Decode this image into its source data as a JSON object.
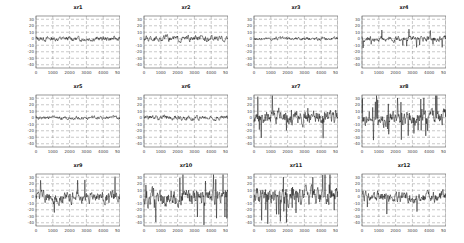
{
  "chart_data": [
    {
      "type": "line",
      "title": "xr1",
      "xlim": [
        0,
        5000
      ],
      "ylim": [
        -45,
        35
      ],
      "xticks": [
        0,
        1000,
        2000,
        3000,
        4000,
        5000
      ],
      "yticks": [
        30,
        20,
        10,
        0,
        -10,
        -20,
        -30,
        -40
      ],
      "grid": "dashed",
      "amplitude": 4,
      "spikes": 0
    },
    {
      "type": "line",
      "title": "xr2",
      "xlim": [
        0,
        5000
      ],
      "ylim": [
        -45,
        35
      ],
      "xticks": [
        0,
        1000,
        2000,
        3000,
        4000,
        5000
      ],
      "yticks": [
        30,
        20,
        10,
        0,
        -10,
        -20,
        -30,
        -40
      ],
      "grid": "dashed",
      "amplitude": 5,
      "spikes": 0
    },
    {
      "type": "line",
      "title": "xr3",
      "xlim": [
        0,
        5000
      ],
      "ylim": [
        -45,
        35
      ],
      "xticks": [
        0,
        1000,
        2000,
        3000,
        4000,
        5000
      ],
      "yticks": [
        30,
        20,
        10,
        0,
        -10,
        -20,
        -30,
        -40
      ],
      "grid": "dashed",
      "amplitude": 3,
      "spikes": 0
    },
    {
      "type": "line",
      "title": "xr4",
      "xlim": [
        0,
        5000
      ],
      "ylim": [
        -45,
        35
      ],
      "xticks": [
        0,
        1000,
        2000,
        3000,
        4000,
        5000
      ],
      "yticks": [
        30,
        20,
        10,
        0,
        -10,
        -20,
        -30,
        -40
      ],
      "grid": "dashed",
      "amplitude": 5,
      "spikes": 6
    },
    {
      "type": "line",
      "title": "xr5",
      "xlim": [
        0,
        5000
      ],
      "ylim": [
        -45,
        35
      ],
      "xticks": [
        0,
        1000,
        2000,
        3000,
        4000,
        5000
      ],
      "yticks": [
        30,
        20,
        10,
        0,
        -10,
        -20,
        -30,
        -40
      ],
      "grid": "dashed",
      "amplitude": 3,
      "spikes": 0
    },
    {
      "type": "line",
      "title": "xr6",
      "xlim": [
        0,
        5000
      ],
      "ylim": [
        -45,
        35
      ],
      "xticks": [
        0,
        1000,
        2000,
        3000,
        4000,
        5000
      ],
      "yticks": [
        30,
        20,
        10,
        0,
        -10,
        -20,
        -30,
        -40
      ],
      "grid": "dashed",
      "amplitude": 4,
      "spikes": 0
    },
    {
      "type": "line",
      "title": "xr7",
      "xlim": [
        0,
        5000
      ],
      "ylim": [
        -45,
        35
      ],
      "xticks": [
        0,
        1000,
        2000,
        3000,
        4000,
        5000
      ],
      "yticks": [
        30,
        20,
        10,
        0,
        -10,
        -20,
        -30,
        -40
      ],
      "grid": "dashed",
      "amplitude": 12,
      "spikes": 6
    },
    {
      "type": "line",
      "title": "xr8",
      "xlim": [
        0,
        5000
      ],
      "ylim": [
        -45,
        35
      ],
      "xticks": [
        0,
        1000,
        2000,
        3000,
        4000,
        5000
      ],
      "yticks": [
        30,
        20,
        10,
        0,
        -10,
        -20,
        -30,
        -40
      ],
      "grid": "dashed",
      "amplitude": 13,
      "spikes": 10
    },
    {
      "type": "line",
      "title": "xr9",
      "xlim": [
        0,
        5000
      ],
      "ylim": [
        -45,
        35
      ],
      "xticks": [
        0,
        1000,
        2000,
        3000,
        4000,
        5000
      ],
      "yticks": [
        30,
        20,
        10,
        0,
        -10,
        -20,
        -30,
        -40
      ],
      "grid": "dashed",
      "amplitude": 10,
      "spikes": 4
    },
    {
      "type": "line",
      "title": "xr10",
      "xlim": [
        0,
        5000
      ],
      "ylim": [
        -45,
        35
      ],
      "xticks": [
        0,
        1000,
        2000,
        3000,
        4000,
        5000
      ],
      "yticks": [
        30,
        20,
        10,
        0,
        -10,
        -20,
        -30,
        -40
      ],
      "grid": "dashed",
      "amplitude": 14,
      "spikes": 12
    },
    {
      "type": "line",
      "title": "xr11",
      "xlim": [
        0,
        5000
      ],
      "ylim": [
        -45,
        35
      ],
      "xticks": [
        0,
        1000,
        2000,
        3000,
        4000,
        5000
      ],
      "yticks": [
        30,
        20,
        10,
        0,
        -10,
        -20,
        -30,
        -40
      ],
      "grid": "dashed",
      "amplitude": 15,
      "spikes": 12
    },
    {
      "type": "line",
      "title": "xr12",
      "xlim": [
        0,
        5000
      ],
      "ylim": [
        -45,
        35
      ],
      "xticks": [
        0,
        1000,
        2000,
        3000,
        4000,
        5000
      ],
      "yticks": [
        30,
        20,
        10,
        0,
        -10,
        -20,
        -30,
        -40
      ],
      "grid": "dashed",
      "amplitude": 9,
      "spikes": 5
    }
  ],
  "layout": {
    "positions": [
      [
        8,
        4
      ],
      [
        116,
        4
      ],
      [
        226,
        4
      ],
      [
        334,
        4
      ],
      [
        8,
        83
      ],
      [
        116,
        83
      ],
      [
        226,
        83
      ],
      [
        334,
        83
      ],
      [
        8,
        162
      ],
      [
        116,
        162
      ],
      [
        226,
        162
      ],
      [
        334,
        162
      ]
    ]
  }
}
